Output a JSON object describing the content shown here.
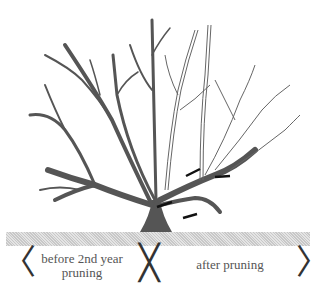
{
  "diagram": {
    "labels": {
      "before": "before 2nd year pruning",
      "after": "after pruning"
    },
    "brackets": {
      "left": "〈",
      "middle": "╳",
      "right": "〉"
    },
    "colors": {
      "pruned_wood": "#555555",
      "remaining_wood_outline": "#666666",
      "ground": "#d0d0d0",
      "cut_marks": "#111111"
    },
    "cut_marks_count": 4
  }
}
